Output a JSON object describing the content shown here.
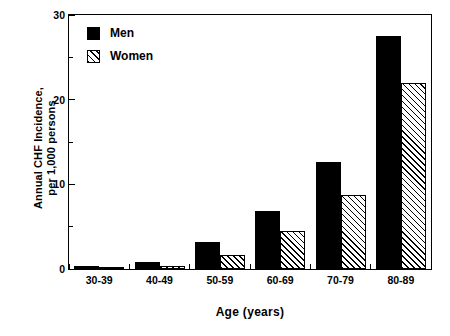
{
  "chart_data": {
    "type": "bar",
    "title": "",
    "xlabel": "Age (years)",
    "ylabel": "Annual CHF Incidence,\nper 1,000 persons",
    "categories": [
      "30-39",
      "40-49",
      "50-59",
      "60-69",
      "70-79",
      "80-89"
    ],
    "series": [
      {
        "name": "Men",
        "values": [
          0.4,
          0.8,
          3.2,
          6.8,
          12.6,
          27.5
        ],
        "color": "#000000",
        "fill": "solid"
      },
      {
        "name": "Women",
        "values": [
          0.1,
          0.4,
          1.7,
          4.5,
          8.7,
          22.0
        ],
        "color": "#000000",
        "fill": "diagonal-hatch"
      }
    ],
    "ylim": [
      0,
      30
    ],
    "yticks_major": [
      0,
      10,
      20,
      30
    ],
    "yticks_minor": [
      5,
      15,
      25
    ],
    "ytick_labels": [
      "0",
      "10",
      "20",
      "30"
    ],
    "grid": false,
    "legend_position": "top-left",
    "legend_entries": [
      "Men",
      "Women"
    ]
  },
  "axes": {
    "y_title_line1": "Annual CHF Incidence,",
    "y_title_line2": "per 1,000 persons",
    "x_title": "Age (years)"
  }
}
